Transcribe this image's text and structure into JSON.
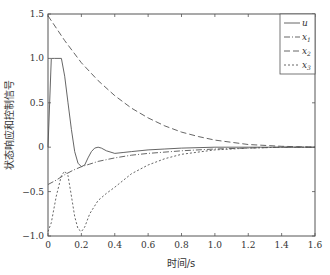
{
  "chart_data": {
    "type": "line",
    "title": "",
    "xlabel": "时间/s",
    "ylabel": "状态响应和控制信号",
    "xlim": [
      0,
      1.6
    ],
    "ylim": [
      -1.0,
      1.5
    ],
    "xticks": [
      "0",
      "0.2",
      "0.4",
      "0.6",
      "0.8",
      "1.0",
      "1.2",
      "1.4",
      "1.6"
    ],
    "yticks": [
      "1.5",
      "1.0",
      "0.5",
      "0",
      "-0.5",
      "-1.0"
    ],
    "grid": false,
    "legend_position": "upper right",
    "series": [
      {
        "name": "u",
        "style": "solid",
        "x": [
          0,
          0.02,
          0.04,
          0.06,
          0.08,
          0.1,
          0.12,
          0.14,
          0.16,
          0.18,
          0.2,
          0.22,
          0.24,
          0.26,
          0.28,
          0.3,
          0.32,
          0.35,
          0.4,
          0.45,
          0.5,
          0.6,
          0.7,
          0.8,
          1.0,
          1.2,
          1.4,
          1.6
        ],
        "values": [
          0,
          1.0,
          1.0,
          1.0,
          1.0,
          0.8,
          0.5,
          0.2,
          -0.05,
          -0.18,
          -0.22,
          -0.2,
          -0.12,
          -0.05,
          -0.01,
          0.0,
          -0.01,
          -0.04,
          -0.07,
          -0.06,
          -0.05,
          -0.03,
          -0.02,
          -0.01,
          0.0,
          0.0,
          0.0,
          0.0
        ]
      },
      {
        "name": "x1",
        "style": "dash-dot",
        "x": [
          0,
          0.05,
          0.1,
          0.15,
          0.2,
          0.25,
          0.3,
          0.4,
          0.5,
          0.6,
          0.8,
          1.0,
          1.2,
          1.4,
          1.6
        ],
        "values": [
          -0.42,
          -0.37,
          -0.31,
          -0.26,
          -0.22,
          -0.19,
          -0.16,
          -0.12,
          -0.09,
          -0.07,
          -0.04,
          -0.02,
          -0.01,
          0.0,
          0.0
        ]
      },
      {
        "name": "x2",
        "style": "dashed",
        "x": [
          0,
          0.1,
          0.2,
          0.3,
          0.4,
          0.5,
          0.6,
          0.7,
          0.8,
          0.9,
          1.0,
          1.2,
          1.4,
          1.6
        ],
        "values": [
          1.48,
          1.2,
          0.95,
          0.75,
          0.58,
          0.44,
          0.33,
          0.24,
          0.17,
          0.12,
          0.08,
          0.03,
          0.01,
          0.0
        ]
      },
      {
        "name": "x3",
        "style": "dotted",
        "x": [
          0,
          0.02,
          0.05,
          0.08,
          0.1,
          0.12,
          0.14,
          0.16,
          0.18,
          0.2,
          0.22,
          0.25,
          0.3,
          0.35,
          0.4,
          0.5,
          0.6,
          0.7,
          0.8,
          1.0,
          1.2,
          1.4,
          1.6
        ],
        "values": [
          -0.95,
          -0.85,
          -0.55,
          -0.32,
          -0.27,
          -0.32,
          -0.55,
          -0.78,
          -0.92,
          -0.95,
          -0.9,
          -0.75,
          -0.6,
          -0.52,
          -0.45,
          -0.3,
          -0.2,
          -0.13,
          -0.08,
          -0.03,
          -0.01,
          0.0,
          0.0
        ]
      }
    ]
  },
  "legend": {
    "entries": [
      {
        "label": "u",
        "sub": ""
      },
      {
        "label": "x",
        "sub": "1"
      },
      {
        "label": "x",
        "sub": "2"
      },
      {
        "label": "x",
        "sub": "3"
      }
    ]
  },
  "axes": {
    "xlabel": "时间/s",
    "ylabel": "状态响应和控制信号"
  }
}
